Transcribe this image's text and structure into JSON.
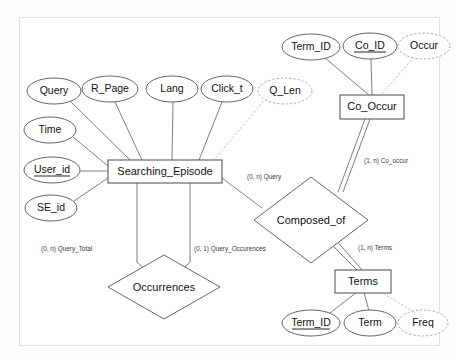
{
  "diagram": {
    "type": "er-diagram",
    "entities": [
      {
        "id": "searching_episode",
        "label": "Searching_Episode",
        "x": 165,
        "y": 171,
        "w": 114,
        "h": 23
      },
      {
        "id": "co_occur",
        "label": "Co_Occur",
        "x": 372,
        "y": 107,
        "w": 64,
        "h": 24
      },
      {
        "id": "terms",
        "label": "Terms",
        "x": 363,
        "y": 281,
        "w": 56,
        "h": 23
      }
    ],
    "relationships": [
      {
        "id": "occurrences",
        "label": "Occurrences",
        "x": 164,
        "y": 287,
        "rx": 56,
        "ry": 32
      },
      {
        "id": "composed_of",
        "label": "Composed_of",
        "x": 311,
        "y": 220,
        "rx": 57,
        "ry": 43
      }
    ],
    "attributes": [
      {
        "id": "query",
        "label": "Query",
        "x": 54,
        "y": 91,
        "rx": 27,
        "ry": 13,
        "derived": false,
        "key": false,
        "owner": "searching_episode"
      },
      {
        "id": "r_page",
        "label": "R_Page",
        "x": 110,
        "y": 89,
        "rx": 28,
        "ry": 13,
        "derived": false,
        "key": false,
        "owner": "searching_episode"
      },
      {
        "id": "lang",
        "label": "Lang",
        "x": 172,
        "y": 89,
        "rx": 26,
        "ry": 13,
        "derived": false,
        "key": false,
        "owner": "searching_episode"
      },
      {
        "id": "click_t",
        "label": "Click_t",
        "x": 227,
        "y": 89,
        "rx": 26,
        "ry": 13,
        "derived": false,
        "key": false,
        "owner": "searching_episode"
      },
      {
        "id": "q_len",
        "label": "Q_Len",
        "x": 285,
        "y": 91,
        "rx": 27,
        "ry": 13,
        "derived": true,
        "key": false,
        "owner": "searching_episode"
      },
      {
        "id": "time",
        "label": "Time",
        "x": 50,
        "y": 130,
        "rx": 26,
        "ry": 13,
        "derived": false,
        "key": false,
        "owner": "searching_episode"
      },
      {
        "id": "user_id",
        "label": "User_id",
        "x": 52,
        "y": 170,
        "rx": 28,
        "ry": 13,
        "derived": false,
        "key": true,
        "owner": "searching_episode"
      },
      {
        "id": "se_id",
        "label": "SE_id",
        "x": 51,
        "y": 208,
        "rx": 26,
        "ry": 13,
        "derived": false,
        "key": false,
        "owner": "searching_episode"
      },
      {
        "id": "co_term_id",
        "label": "Term_ID",
        "x": 311,
        "y": 47,
        "rx": 29,
        "ry": 13,
        "derived": false,
        "key": false,
        "owner": "co_occur"
      },
      {
        "id": "co_id",
        "label": "Co_ID",
        "x": 370,
        "y": 46,
        "rx": 27,
        "ry": 13,
        "derived": false,
        "key": true,
        "owner": "co_occur"
      },
      {
        "id": "occur",
        "label": "Occur",
        "x": 424,
        "y": 46,
        "rx": 26,
        "ry": 13,
        "derived": true,
        "key": false,
        "owner": "co_occur"
      },
      {
        "id": "t_term_id",
        "label": "Term_ID",
        "x": 311,
        "y": 323,
        "rx": 29,
        "ry": 13,
        "derived": false,
        "key": true,
        "owner": "terms"
      },
      {
        "id": "term",
        "label": "Term",
        "x": 370,
        "y": 323,
        "rx": 26,
        "ry": 13,
        "derived": false,
        "key": false,
        "owner": "terms"
      },
      {
        "id": "freq",
        "label": "Freq",
        "x": 423,
        "y": 323,
        "rx": 25,
        "ry": 13,
        "derived": true,
        "key": false,
        "owner": "terms"
      }
    ],
    "cardinality_labels": [
      {
        "id": "query_total",
        "text": "(0, n) Query_Total",
        "x": 41,
        "y": 249
      },
      {
        "id": "query_occurrences",
        "text": "(0, 1) Query_Occurences",
        "x": 194,
        "y": 249
      },
      {
        "id": "query",
        "text": "(0, n) Query",
        "x": 247,
        "y": 177
      },
      {
        "id": "co_occur_card",
        "text": "(1, n) Co_occur",
        "x": 364,
        "y": 161
      },
      {
        "id": "terms_card",
        "text": "(1, n) Terms",
        "x": 358,
        "y": 248
      }
    ],
    "frame": {
      "x": 19,
      "y": 17,
      "w": 421,
      "h": 329
    }
  }
}
